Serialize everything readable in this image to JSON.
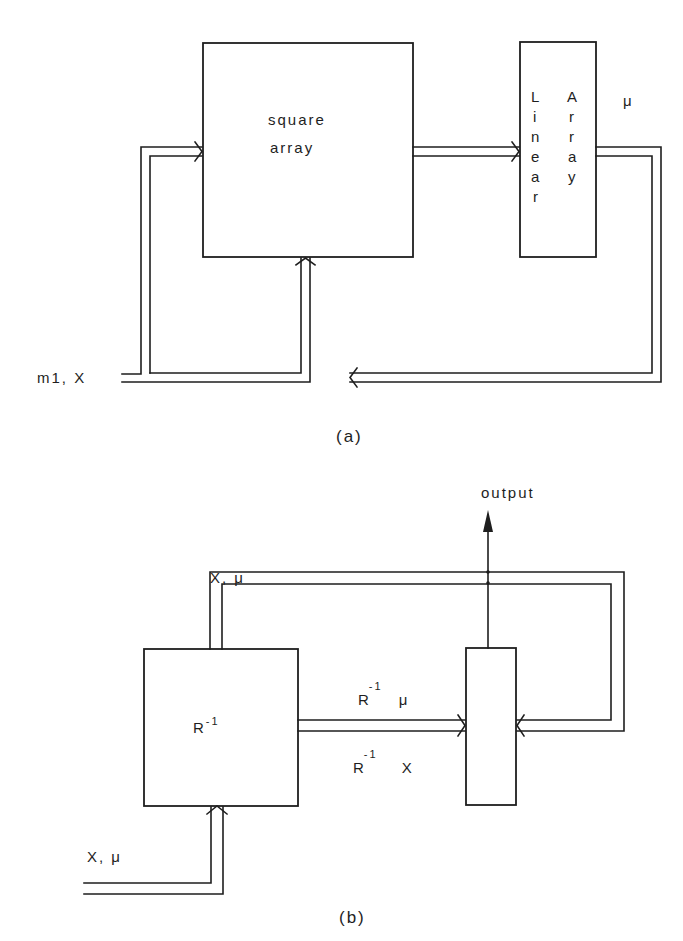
{
  "diagram_a": {
    "caption": "(a)",
    "square_array": {
      "line1": "square",
      "line2": "array"
    },
    "linear_array": {
      "left_letters": [
        "L",
        "i",
        "n",
        "e",
        "a",
        "r"
      ],
      "right_letters": [
        "A",
        "r",
        "r",
        "a",
        "y"
      ]
    },
    "output_label": "μ",
    "input_label": "m1, X"
  },
  "diagram_b": {
    "caption": "(b)",
    "r_inverse_box": {
      "base": "R",
      "exp": "-1"
    },
    "top_feedback_label": "X, μ",
    "output_label": "output",
    "upper_pipe_label": {
      "base": "R",
      "exp": "-1",
      "var": "μ"
    },
    "lower_pipe_label": {
      "base": "R",
      "exp": "-1",
      "var": "X"
    },
    "input_label": "X, μ"
  }
}
